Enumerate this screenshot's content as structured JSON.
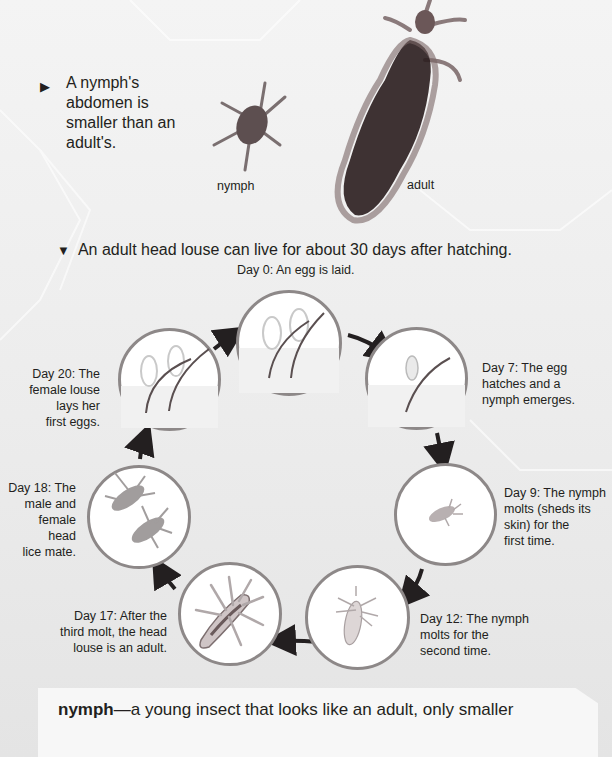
{
  "page": {
    "background_color": "#ececec",
    "accent_color": "#231f20",
    "circle_border_color": "#8d8888"
  },
  "photo_section": {
    "caption_marker": "▶",
    "caption": "A nymph's abdomen is smaller than an adult's.",
    "labels": {
      "nymph": "nymph",
      "adult": "adult"
    }
  },
  "life_cycle": {
    "caption_marker": "▼",
    "caption": "An adult head louse can live for about 30 days after hatching.",
    "steps": [
      {
        "day": "Day 0",
        "label": "Day 0: An egg is laid.",
        "image": "eggs-on-hair"
      },
      {
        "day": "Day 7",
        "label": "Day 7: The egg hatches and a nymph emerges.",
        "image": "hatching-egg"
      },
      {
        "day": "Day 9",
        "label": "Day 9: The nymph molts (sheds its skin) for the first time.",
        "image": "small-nymph"
      },
      {
        "day": "Day 12",
        "label": "Day 12: The nymph molts for the second time.",
        "image": "larger-nymph"
      },
      {
        "day": "Day 17",
        "label": "Day 17: After the third molt, the head louse is an adult.",
        "image": "adult-louse"
      },
      {
        "day": "Day 18",
        "label": "Day 18: The male and female head lice mate.",
        "image": "two-lice"
      },
      {
        "day": "Day 20",
        "label": "Day 20: The female louse lays her first eggs.",
        "image": "eggs-on-hair"
      }
    ],
    "label_lines": {
      "day0": [
        "Day 0: An egg is laid."
      ],
      "day7": [
        "Day 7: The egg",
        "hatches and a",
        "nymph emerges."
      ],
      "day9": [
        "Day 9: The nymph",
        "molts (sheds its",
        "skin) for the",
        "first time."
      ],
      "day12": [
        "Day 12: The nymph",
        "molts for the",
        "second time."
      ],
      "day17": [
        "Day 17: After the",
        "third molt, the head",
        "louse is an adult."
      ],
      "day18": [
        "Day 18: The",
        "male and",
        "female head",
        "lice mate."
      ],
      "day20": [
        "Day 20: The",
        "female louse",
        "lays her",
        "first eggs."
      ]
    }
  },
  "glossary": {
    "term": "nymph",
    "separator": "—",
    "definition": "a young insect that looks like an adult, only smaller"
  }
}
